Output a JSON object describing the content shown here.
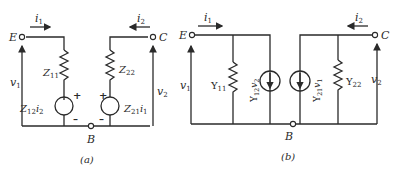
{
  "figure": {
    "panel_a": {
      "caption": "(a)",
      "terminals": {
        "left": "E",
        "right": "C",
        "bottom": "B"
      },
      "currents": {
        "left": "i",
        "left_sub": "1",
        "right": "i",
        "right_sub": "2"
      },
      "voltages": {
        "left": "v",
        "left_sub": "1",
        "right": "v",
        "right_sub": "2"
      },
      "elements": {
        "z11": {
          "main": "Z",
          "sub": "11"
        },
        "z22": {
          "main": "Z",
          "sub": "22"
        },
        "src_left": {
          "main": "Z",
          "sub": "12",
          "var": "i",
          "var_sub": "2"
        },
        "src_right": {
          "main": "Z",
          "sub": "21",
          "var": "i",
          "var_sub": "1"
        }
      },
      "polarity": {
        "plus": "+",
        "minus": "–"
      }
    },
    "panel_b": {
      "caption": "(b)",
      "terminals": {
        "left": "E",
        "right": "C",
        "bottom": "B"
      },
      "currents": {
        "left": "i",
        "left_sub": "1",
        "right": "i",
        "right_sub": "2"
      },
      "voltages": {
        "left": "v",
        "left_sub": "1",
        "right": "v",
        "right_sub": "2"
      },
      "elements": {
        "y11": {
          "main": "Y",
          "sub": "11"
        },
        "y22": {
          "main": "Y",
          "sub": "22"
        },
        "src_left": {
          "main": "Y",
          "sub": "12",
          "var": "v",
          "var_sub": "2"
        },
        "src_right": {
          "main": "Y",
          "sub": "21",
          "var": "v",
          "var_sub": "1"
        }
      }
    },
    "colors": {
      "ink": "#2a2a2a",
      "background": "#ffffff"
    }
  }
}
